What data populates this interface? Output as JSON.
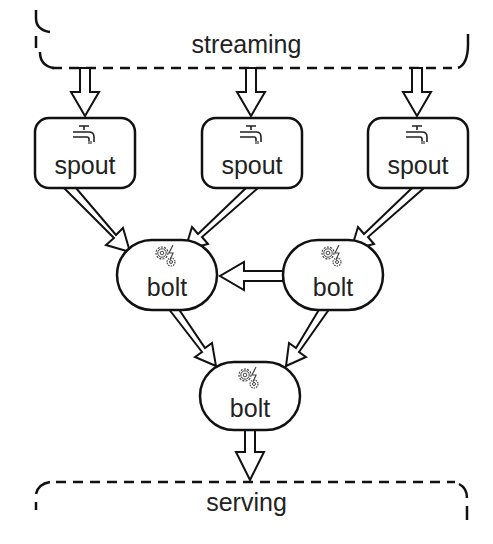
{
  "diagram": {
    "type": "storm-topology",
    "source": {
      "label": "streaming"
    },
    "sink": {
      "label": "serving"
    },
    "nodes": [
      {
        "id": "spout1",
        "kind": "spout",
        "label": "spout",
        "icon": "faucet-icon"
      },
      {
        "id": "spout2",
        "kind": "spout",
        "label": "spout",
        "icon": "faucet-icon"
      },
      {
        "id": "spout3",
        "kind": "spout",
        "label": "spout",
        "icon": "faucet-icon"
      },
      {
        "id": "bolt1",
        "kind": "bolt",
        "label": "bolt",
        "icon": "gears-lightning-icon"
      },
      {
        "id": "bolt2",
        "kind": "bolt",
        "label": "bolt",
        "icon": "gears-lightning-icon"
      },
      {
        "id": "bolt3",
        "kind": "bolt",
        "label": "bolt",
        "icon": "gears-lightning-icon"
      }
    ],
    "edges": [
      {
        "from": "streaming",
        "to": "spout1"
      },
      {
        "from": "streaming",
        "to": "spout2"
      },
      {
        "from": "streaming",
        "to": "spout3"
      },
      {
        "from": "spout1",
        "to": "bolt1"
      },
      {
        "from": "spout2",
        "to": "bolt1"
      },
      {
        "from": "spout3",
        "to": "bolt2"
      },
      {
        "from": "bolt2",
        "to": "bolt1"
      },
      {
        "from": "bolt1",
        "to": "bolt3"
      },
      {
        "from": "bolt2",
        "to": "bolt3"
      },
      {
        "from": "bolt3",
        "to": "serving"
      }
    ],
    "colors": {
      "stroke": "#111111",
      "text": "#222222",
      "background": "#ffffff"
    }
  }
}
